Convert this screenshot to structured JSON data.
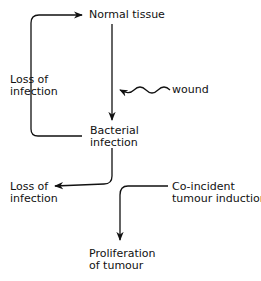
{
  "diagram": {
    "nodes": {
      "normal_tissue": "Normal tissue",
      "loss_left_1": "Loss of",
      "loss_left_2": "infection",
      "wound": "wound",
      "bacterial_1": "Bacterial",
      "bacterial_2": "infection",
      "loss_bottom_1": "Loss of",
      "loss_bottom_2": "infection",
      "coincident_1": "Co-incident",
      "coincident_2": "tumour induction",
      "proliferation_1": "Proliferation",
      "proliferation_2": "of tumour"
    },
    "edges": [
      {
        "from": "Bacterial infection",
        "to": "Normal tissue",
        "label": "Loss of infection"
      },
      {
        "from": "Normal tissue",
        "to": "Bacterial infection",
        "via": "wound"
      },
      {
        "from": "Bacterial infection",
        "to": "Loss of infection"
      },
      {
        "from": "Co-incident tumour induction",
        "to": "Proliferation of tumour"
      }
    ],
    "stroke_color": "#111111"
  }
}
